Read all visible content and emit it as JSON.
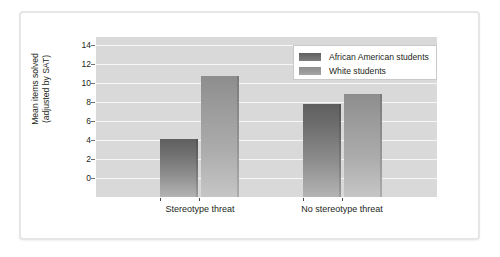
{
  "chart_data": {
    "type": "bar",
    "title": "",
    "subtitle": "",
    "xlabel": "",
    "ylabel": "Mean items solved (adjusted by SAT)",
    "ylabel_lines": [
      "Mean items solved",
      "(adjusted by SAT)"
    ],
    "categories": [
      "Stereotype threat",
      "No stereotype threat"
    ],
    "series": [
      {
        "name": "African American students",
        "values": [
          5.3,
          8.4
        ],
        "color": "#6d6d6d"
      },
      {
        "name": "White students",
        "values": [
          11.0,
          9.3
        ],
        "color": "#9b9b9b"
      }
    ],
    "ylim": [
      0,
      14.5
    ],
    "yticks": [
      0,
      2,
      4,
      6,
      8,
      10,
      12,
      14
    ],
    "ytick_labels": [
      "0",
      "2",
      "4",
      "6",
      "8",
      "10",
      "12",
      "14"
    ],
    "grid": "horizontal",
    "grid_color": "#f7f7f7",
    "plot_background": "#d9d9d9",
    "legend_position": "top-right",
    "legend_entries": [
      "African American students",
      "White students"
    ]
  },
  "frame": {
    "border_color": "#e6e6e6",
    "background": "#ffffff"
  }
}
